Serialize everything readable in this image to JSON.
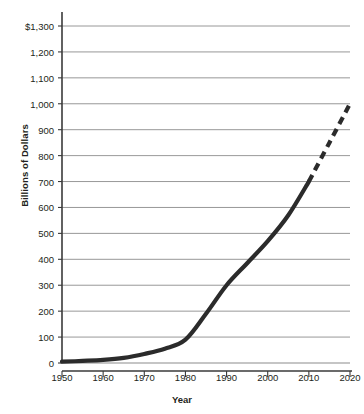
{
  "chart_data": {
    "type": "line",
    "title": "",
    "xlabel": "Year",
    "ylabel": "Billions of Dollars",
    "xlim": [
      1950,
      2020
    ],
    "ylim": [
      0,
      1300
    ],
    "grid": true,
    "legend": "none",
    "y_ticks": [
      0,
      100,
      200,
      300,
      400,
      500,
      600,
      700,
      800,
      900,
      1000,
      1100,
      1200,
      1300
    ],
    "y_tick_labels": [
      "0",
      "100",
      "200",
      "300",
      "400",
      "500",
      "600",
      "700",
      "800",
      "900",
      "1,000",
      "1,100",
      "1,200",
      "$1,300"
    ],
    "x_ticks": [
      1950,
      1960,
      1970,
      1980,
      1990,
      2000,
      2010,
      2020
    ],
    "x_tick_labels": [
      "1950",
      "1960",
      "1970",
      "1980",
      "1990",
      "2000",
      "2010",
      "2020"
    ],
    "series": [
      {
        "name": "actual",
        "style": "solid",
        "color": "#2b2b2b",
        "x": [
          1950,
          1955,
          1960,
          1965,
          1970,
          1975,
          1980,
          1985,
          1990,
          1995,
          2000,
          2005,
          2010
        ],
        "values": [
          5,
          8,
          12,
          20,
          35,
          55,
          90,
          190,
          300,
          385,
          470,
          570,
          700
        ]
      },
      {
        "name": "projected",
        "style": "dashed",
        "color": "#2b2b2b",
        "x": [
          2010,
          2015,
          2020
        ],
        "values": [
          700,
          850,
          1000
        ]
      }
    ],
    "colors": {
      "line": "#2b2b2b",
      "gridline": "#8c8c8c",
      "axis": "#3a3a3a",
      "background": "#ffffff",
      "text": "#231f20"
    }
  },
  "axes": {
    "y_title": "Billions of Dollars",
    "x_title": "Year"
  }
}
